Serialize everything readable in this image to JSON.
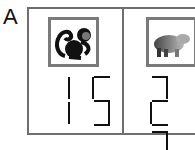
{
  "panel": {
    "label": "A"
  },
  "cells": [
    {
      "animal": "monkey",
      "icon": "monkey-silhouette-icon",
      "number": "15"
    },
    {
      "animal": "bear",
      "icon": "bear-photo-icon",
      "number": "23"
    }
  ],
  "colors": {
    "border": "#6f6f6f",
    "digit": "#111111"
  }
}
